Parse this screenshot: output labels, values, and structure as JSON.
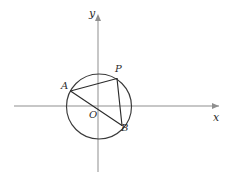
{
  "figure": {
    "background_color": "#ffffff",
    "width": 232,
    "height": 181
  },
  "axes": {
    "x_axis": {
      "label": "x",
      "label_x": 213,
      "label_y": 112,
      "y_pixel": 106,
      "x_start": 14,
      "x_end": 222,
      "color": "#8f8f8f"
    },
    "y_axis": {
      "label": "y",
      "label_x": 89,
      "label_y": 8,
      "x_pixel": 98,
      "y_start": 14,
      "y_end": 172,
      "color": "#8f8f8f"
    },
    "origin": {
      "label": "O",
      "label_x": 89,
      "label_y": 110,
      "x_pixel": 98,
      "y_pixel": 106
    }
  },
  "circle": {
    "center_x": 99,
    "center_y": 106.5,
    "radius": 32.5,
    "stroke_color": "#3a3a3a"
  },
  "points": [
    {
      "name": "A",
      "label": "A",
      "cx": 70.5,
      "cy": 91.0,
      "label_x": 61,
      "label_y": 81
    },
    {
      "name": "P",
      "label": "P",
      "cx": 117.0,
      "cy": 78.5,
      "label_x": 115,
      "label_y": 64
    },
    {
      "name": "B",
      "label": "B",
      "cx": 122.0,
      "cy": 125.5,
      "label_x": 121,
      "label_y": 123
    }
  ],
  "chords": [
    {
      "name": "segment-AP",
      "from": "A",
      "to": "P"
    },
    {
      "name": "segment-PB",
      "from": "P",
      "to": "B"
    },
    {
      "name": "segment-AB",
      "from": "A",
      "to": "B"
    }
  ],
  "colors": {
    "axis": "#8f8f8f",
    "curve": "#3a3a3a",
    "chord": "#2b2b2b",
    "text": "#2b2b2b"
  }
}
